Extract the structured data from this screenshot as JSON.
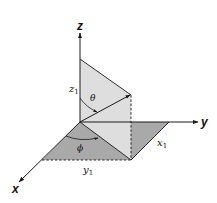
{
  "diagram": {
    "type": "3d-coordinate-system",
    "axes": {
      "x": "x",
      "y": "y",
      "z": "z"
    },
    "labels": {
      "z1": "z",
      "z1_sub": "1",
      "x1": "x",
      "x1_sub": "1",
      "y1": "y",
      "y1_sub": "1",
      "theta": "θ",
      "phi": "ϕ"
    },
    "colors": {
      "floor_fill": "#a6a6a6",
      "vertical_plane_fill": "#dcdcdc",
      "lines": "#1a1a1a",
      "background": "#ffffff"
    }
  }
}
